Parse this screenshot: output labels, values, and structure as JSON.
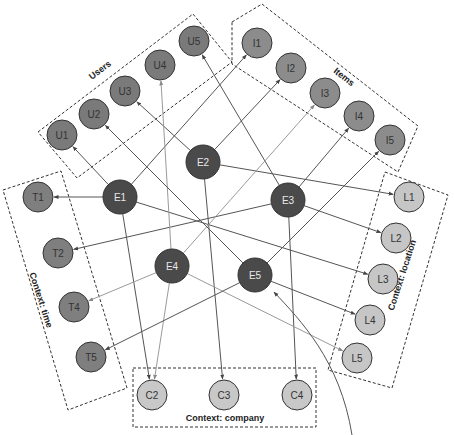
{
  "colors": {
    "entity_fill": "#4a4a4a",
    "entity_text": "#e8e8e8",
    "user_fill": "#7a7a7a",
    "item_fill": "#8c8c8c",
    "time_fill": "#7f7f7f",
    "location_fill": "#c6c6c6",
    "company_fill": "#c8c8c8",
    "dark_text": "#333333",
    "edge_dark": "#555555",
    "edge_light": "#9a9a9a"
  },
  "groups": [
    {
      "id": "users",
      "label": "Users",
      "box": [
        [
          38,
          132
        ],
        [
          193,
          14
        ],
        [
          232,
          62
        ],
        [
          77,
          178
        ]
      ],
      "label_pos": [
        100,
        70
      ],
      "label_rot": -37
    },
    {
      "id": "items",
      "label": "Items",
      "box": [
        [
          232,
          22
        ],
        [
          262,
          4
        ],
        [
          418,
          126
        ],
        [
          398,
          172
        ],
        [
          232,
          64
        ]
      ],
      "label_pos": [
        344,
        77
      ],
      "label_rot": 38
    },
    {
      "id": "time",
      "label": "Context: time",
      "box": [
        [
          3,
          190
        ],
        [
          61,
          171
        ],
        [
          127,
          388
        ],
        [
          68,
          410
        ]
      ],
      "label_pos": [
        41,
        300
      ],
      "label_rot": 72
    },
    {
      "id": "location",
      "label": "Context: location",
      "box": [
        [
          385,
          172
        ],
        [
          448,
          195
        ],
        [
          392,
          388
        ],
        [
          328,
          370
        ]
      ],
      "label_pos": [
        402,
        275
      ],
      "label_rot": -72
    },
    {
      "id": "company",
      "label": "Context: company",
      "box": [
        [
          133,
          368
        ],
        [
          316,
          368
        ],
        [
          316,
          427
        ],
        [
          133,
          427
        ]
      ],
      "label_pos": [
        225,
        418
      ],
      "label_rot": 0
    }
  ],
  "nodes": [
    {
      "id": "U1",
      "label": "U1",
      "x": 62,
      "y": 135,
      "r": 15,
      "type": "user"
    },
    {
      "id": "U2",
      "label": "U2",
      "x": 94,
      "y": 114,
      "r": 15,
      "type": "user"
    },
    {
      "id": "U3",
      "label": "U3",
      "x": 125,
      "y": 91,
      "r": 15,
      "type": "user"
    },
    {
      "id": "U4",
      "label": "U4",
      "x": 160,
      "y": 65,
      "r": 15,
      "type": "user"
    },
    {
      "id": "U5",
      "label": "U5",
      "x": 194,
      "y": 41,
      "r": 15,
      "type": "user"
    },
    {
      "id": "I1",
      "label": "I1",
      "x": 257,
      "y": 43,
      "r": 15,
      "type": "item"
    },
    {
      "id": "I2",
      "label": "I2",
      "x": 291,
      "y": 68,
      "r": 15,
      "type": "item"
    },
    {
      "id": "I3",
      "label": "I3",
      "x": 325,
      "y": 93,
      "r": 15,
      "type": "item"
    },
    {
      "id": "I4",
      "label": "I4",
      "x": 359,
      "y": 116,
      "r": 15,
      "type": "item"
    },
    {
      "id": "I5",
      "label": "I5",
      "x": 390,
      "y": 140,
      "r": 15,
      "type": "item"
    },
    {
      "id": "T1",
      "label": "T1",
      "x": 38,
      "y": 197,
      "r": 15,
      "type": "time"
    },
    {
      "id": "T2",
      "label": "T2",
      "x": 58,
      "y": 253,
      "r": 15,
      "type": "time"
    },
    {
      "id": "T4",
      "label": "T4",
      "x": 74,
      "y": 307,
      "r": 15,
      "type": "time"
    },
    {
      "id": "T5",
      "label": "T5",
      "x": 91,
      "y": 357,
      "r": 15,
      "type": "time"
    },
    {
      "id": "L1",
      "label": "L1",
      "x": 409,
      "y": 197,
      "r": 15,
      "type": "location"
    },
    {
      "id": "L2",
      "label": "L2",
      "x": 396,
      "y": 238,
      "r": 15,
      "type": "location"
    },
    {
      "id": "L3",
      "label": "L3",
      "x": 383,
      "y": 279,
      "r": 15,
      "type": "location"
    },
    {
      "id": "L4",
      "label": "L4",
      "x": 370,
      "y": 320,
      "r": 15,
      "type": "location"
    },
    {
      "id": "L5",
      "label": "L5",
      "x": 357,
      "y": 358,
      "r": 15,
      "type": "location"
    },
    {
      "id": "C2",
      "label": "C2",
      "x": 152,
      "y": 395,
      "r": 15,
      "type": "company"
    },
    {
      "id": "C3",
      "label": "C3",
      "x": 224,
      "y": 395,
      "r": 15,
      "type": "company"
    },
    {
      "id": "C4",
      "label": "C4",
      "x": 297,
      "y": 395,
      "r": 15,
      "type": "company"
    },
    {
      "id": "E1",
      "label": "E1",
      "x": 120,
      "y": 197,
      "r": 17,
      "type": "entity"
    },
    {
      "id": "E2",
      "label": "E2",
      "x": 203,
      "y": 162,
      "r": 17,
      "type": "entity"
    },
    {
      "id": "E3",
      "label": "E3",
      "x": 288,
      "y": 200,
      "r": 17,
      "type": "entity"
    },
    {
      "id": "E4",
      "label": "E4",
      "x": 172,
      "y": 266,
      "r": 17,
      "type": "entity"
    },
    {
      "id": "E5",
      "label": "E5",
      "x": 255,
      "y": 275,
      "r": 17,
      "type": "entity"
    }
  ],
  "edges": [
    {
      "from": "E1",
      "to": "U1",
      "tone": "dark"
    },
    {
      "from": "E1",
      "to": "T1",
      "tone": "dark"
    },
    {
      "from": "E1",
      "to": "I1",
      "tone": "dark"
    },
    {
      "from": "E1",
      "to": "C2",
      "tone": "dark"
    },
    {
      "from": "E1",
      "to": "L3",
      "tone": "dark"
    },
    {
      "from": "E2",
      "to": "U3",
      "tone": "dark"
    },
    {
      "from": "E2",
      "to": "L1",
      "tone": "dark"
    },
    {
      "from": "E2",
      "to": "C3",
      "tone": "dark"
    },
    {
      "from": "E2",
      "to": "I2",
      "tone": "dark"
    },
    {
      "from": "E3",
      "to": "U5",
      "tone": "dark"
    },
    {
      "from": "E3",
      "to": "T2",
      "tone": "dark"
    },
    {
      "from": "E3",
      "to": "L2",
      "tone": "dark"
    },
    {
      "from": "E3",
      "to": "C4",
      "tone": "dark"
    },
    {
      "from": "E3",
      "to": "I4",
      "tone": "dark"
    },
    {
      "from": "E4",
      "to": "U4",
      "tone": "light"
    },
    {
      "from": "E4",
      "to": "I3",
      "tone": "light"
    },
    {
      "from": "E4",
      "to": "T4",
      "tone": "light"
    },
    {
      "from": "E4",
      "to": "C2",
      "tone": "light"
    },
    {
      "from": "E4",
      "to": "L5",
      "tone": "light"
    },
    {
      "from": "E5",
      "to": "U2",
      "tone": "dark"
    },
    {
      "from": "E5",
      "to": "I5",
      "tone": "dark"
    },
    {
      "from": "E5",
      "to": "T5",
      "tone": "dark"
    },
    {
      "from": "E5",
      "to": "L4",
      "tone": "dark"
    }
  ],
  "curve": {
    "path": "M 352 435 C 340 360, 300 320, 274 292",
    "tone": "dark"
  }
}
